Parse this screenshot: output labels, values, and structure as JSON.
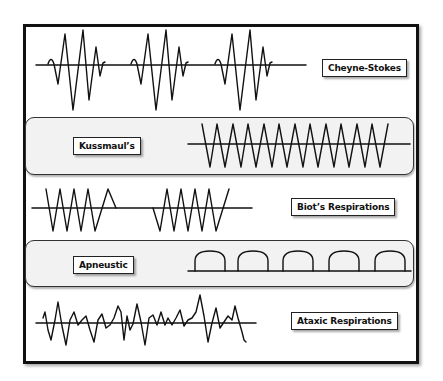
{
  "patterns": [
    {
      "id": "cheyne-stokes",
      "label": "Cheyne-Stokes",
      "shape": "crescendo-decrescendo bursts with apnea",
      "bursts": 3
    },
    {
      "id": "kussmaul",
      "label": "Kussmaul’s",
      "shape": "deep regular rapid zigzag",
      "cycles": 12,
      "shaded": true
    },
    {
      "id": "biot",
      "label": "Biot’s Respirations",
      "shape": "clusters of regular breaths separated by apnea",
      "clusters": 2
    },
    {
      "id": "apneustic",
      "label": "Apneustic",
      "shape": "prolonged inspiratory plateaus (domes)",
      "domes": 5,
      "shaded": true
    },
    {
      "id": "ataxic",
      "label": "Ataxic Respirations",
      "shape": "irregular random amplitude and rate"
    }
  ],
  "colors": {
    "line": "#111111",
    "band_fill": "#f2f2f2",
    "frame": "#111111",
    "label_bg": "#ffffff"
  }
}
